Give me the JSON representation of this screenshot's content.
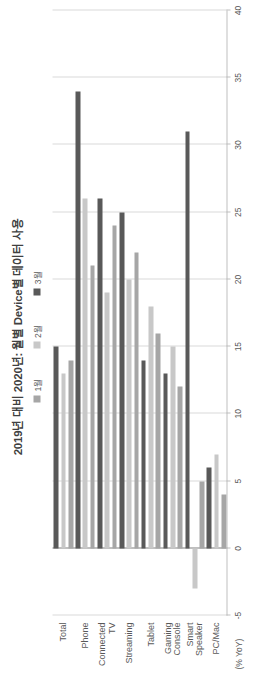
{
  "chart_data": {
    "type": "bar",
    "orientation": "horizontal",
    "title": "2019년 대비 2020년: 월별 Device별 데이터 사용",
    "xlabel": "(% YoY)",
    "ylabel": "",
    "unit_label": "(% YoY)",
    "categories": [
      "Total",
      "Phone",
      "Connected TV",
      "Streaming",
      "Tablet",
      "Gaming Console",
      "Smart Speaker",
      "PC/Mac"
    ],
    "series": [
      {
        "name": "1월",
        "color": "#a6a6a6",
        "values": [
          14,
          21,
          24,
          22,
          16,
          12,
          5,
          4
        ]
      },
      {
        "name": "2월",
        "color": "#c8c8c8",
        "values": [
          13,
          26,
          19,
          20,
          18,
          15,
          -3,
          7
        ]
      },
      {
        "name": "3월",
        "color": "#595959",
        "values": [
          15,
          34,
          26,
          25,
          14,
          13,
          31,
          6
        ]
      }
    ],
    "xlim": [
      -5,
      40
    ],
    "ticks": [
      40,
      35,
      30,
      25,
      20,
      15,
      10,
      5,
      0,
      -5
    ],
    "tick_labels": [
      "40",
      "35",
      "30",
      "25",
      "20",
      "15",
      "10",
      "5",
      "0",
      "-5"
    ],
    "grid": true,
    "legend_position": "top"
  },
  "legend": {
    "items": [
      {
        "label": "1월",
        "color": "#a6a6a6"
      },
      {
        "label": "2월",
        "color": "#c8c8c8"
      },
      {
        "label": "3월",
        "color": "#595959"
      }
    ]
  },
  "colors": {
    "series_1": "#a6a6a6",
    "series_2": "#c8c8c8",
    "series_3": "#595959",
    "axis": "#bfbfbf",
    "zero_line": "#808080",
    "text": "#595959",
    "title": "#404040",
    "background": "#ffffff"
  }
}
